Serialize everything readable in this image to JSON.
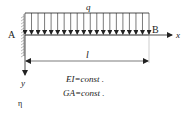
{
  "diagram": {
    "load_label": "q",
    "left_support_label": "A",
    "right_end_label": "B",
    "x_axis_label": "x",
    "y_axis_label": "y",
    "span_label": "l",
    "properties": [
      "EI=const .",
      "GA=const ."
    ],
    "extra_symbol": "η",
    "load_arrow_count": 20,
    "colors": {
      "line": "#222222",
      "hatch": "#555555",
      "background": "#ffffff"
    }
  }
}
